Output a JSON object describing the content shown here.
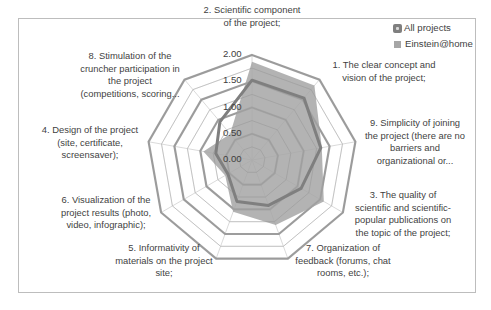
{
  "chart_data": {
    "type": "radar",
    "title": "",
    "axis_order_clockwise_from_top": [
      "2",
      "1",
      "9",
      "3",
      "7",
      "5",
      "6",
      "4",
      "8"
    ],
    "categories": [
      "2. Scientific component of the project;",
      "1. The clear concept and vision of the project;",
      "9. Simplicity of joining the project (there are no barriers and organizational or...",
      "3. The quality of scientific and scientific-popular publications on the topic of the project;",
      "7. Organization of feedback (forums, chat rooms, etc.);",
      "5. Informativity of materials on the project site;",
      "6. Visualization of the project results (photo, video, infographic);",
      "4. Design of the project (site, certificate, screensaver);",
      "8. Stimulation of the cruncher participation in the project (competitions, scoring..."
    ],
    "series": [
      {
        "name": "All projects",
        "style": "line",
        "color": "#7f7f7f",
        "values": [
          1.52,
          1.54,
          1.33,
          1.08,
          0.92,
          0.84,
          0.53,
          0.7,
          0.95
        ]
      },
      {
        "name": "Einstein@home",
        "style": "filled",
        "color": "#a6a6a6",
        "values": [
          1.87,
          1.85,
          1.35,
          1.58,
          1.32,
          1.05,
          0.59,
          0.94,
          0.65
        ]
      }
    ],
    "rlim": [
      0,
      2
    ],
    "tick_labels": [
      "0.00",
      "0.50",
      "1.00",
      "1.50",
      "2.00"
    ],
    "minor_step": 0.25,
    "grid": true,
    "legend_position": "top-right"
  },
  "labels": {
    "axis_2": [
      "2.  Scientific component",
      "of the project;"
    ],
    "axis_1": [
      "1.  The clear concept and",
      "vision of the project;"
    ],
    "axis_9": [
      "9.  Simplicity of joining",
      "the project (there are no",
      "barriers and",
      "organizational or..."
    ],
    "axis_3": [
      "3.  The quality of",
      "scientific and scientific-",
      "popular publications on",
      "the topic of the project;"
    ],
    "axis_7": [
      "7.  Organization of",
      "feedback (forums, chat",
      "rooms, etc.);"
    ],
    "axis_5": [
      "5.  Informativity of",
      "materials on the project",
      "site;"
    ],
    "axis_6": [
      "6.  Visualization of the",
      "project results (photo,",
      "video, infographic);"
    ],
    "axis_4": [
      "4.  Design of the project",
      "(site, certificate,",
      "screensaver);"
    ],
    "axis_8": [
      "8.  Stimulation of the",
      "cruncher participation in",
      "the project",
      "(competitions, scoring..."
    ]
  },
  "legend": {
    "items": [
      {
        "label": "All projects",
        "icon": "line-marker-icon"
      },
      {
        "label": "Einstein@home",
        "icon": "filled-square-icon"
      }
    ]
  }
}
